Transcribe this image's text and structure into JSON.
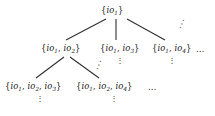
{
  "figure": {
    "name": "subset-lattice-tree",
    "background_color": "#ffffff",
    "text_color": "#202020",
    "edge_color": "#303030"
  },
  "nodes": {
    "root": {
      "id": "root",
      "open_brace": "{",
      "close_brace": "}",
      "items": [
        {
          "symbol": "io",
          "index": "1"
        }
      ],
      "label": "{io1}"
    },
    "level2": [
      {
        "id": "l2-a",
        "open_brace": "{",
        "close_brace": "}",
        "items": [
          {
            "symbol": "io",
            "index": "1"
          },
          {
            "symbol": "io",
            "index": "2"
          }
        ],
        "separator": ", ",
        "label": "{io1, io2}"
      },
      {
        "id": "l2-b",
        "open_brace": "{",
        "close_brace": "}",
        "items": [
          {
            "symbol": "io",
            "index": "1"
          },
          {
            "symbol": "io",
            "index": "3"
          }
        ],
        "separator": ", ",
        "label": "{io1, io3}"
      },
      {
        "id": "l2-c",
        "open_brace": "{",
        "close_brace": "}",
        "items": [
          {
            "symbol": "io",
            "index": "1"
          },
          {
            "symbol": "io",
            "index": "4"
          }
        ],
        "separator": ", ",
        "label": "{io1, io4}",
        "trailing_ellipsis": "…"
      }
    ],
    "level3": [
      {
        "id": "l3-a",
        "open_brace": "{",
        "close_brace": "}",
        "items": [
          {
            "symbol": "io",
            "index": "1"
          },
          {
            "symbol": "io",
            "index": "2"
          },
          {
            "symbol": "io",
            "index": "3"
          }
        ],
        "separator": ", ",
        "label": "{io1, io2, io3}"
      },
      {
        "id": "l3-b",
        "open_brace": "{",
        "close_brace": "}",
        "items": [
          {
            "symbol": "io",
            "index": "1"
          },
          {
            "symbol": "io",
            "index": "2"
          },
          {
            "symbol": "io",
            "index": "4"
          }
        ],
        "separator": ", ",
        "label": "{io1, io2, io4}",
        "trailing_ellipsis": "…"
      }
    ]
  },
  "ellipses": {
    "diagonal_root_right": "⋰",
    "diagonal_l2a_right": "⋰",
    "vertical_under_l2_b": "⋮",
    "vertical_under_l2_c": "⋮",
    "vertical_under_l3_a": "⋮",
    "vertical_under_l3_b": "⋮",
    "trailing_level2": "…",
    "trailing_level3": "…"
  },
  "edges": [
    {
      "from": "root",
      "to": "l2-a",
      "kind": "diagonal-left"
    },
    {
      "from": "root",
      "to": "l2-b",
      "kind": "vertical"
    },
    {
      "from": "root",
      "to": "l2-c",
      "kind": "diagonal-right"
    },
    {
      "from": "l2-a",
      "to": "l3-a",
      "kind": "diagonal-left"
    },
    {
      "from": "l2-a",
      "to": "l3-b",
      "kind": "diagonal-right"
    }
  ]
}
